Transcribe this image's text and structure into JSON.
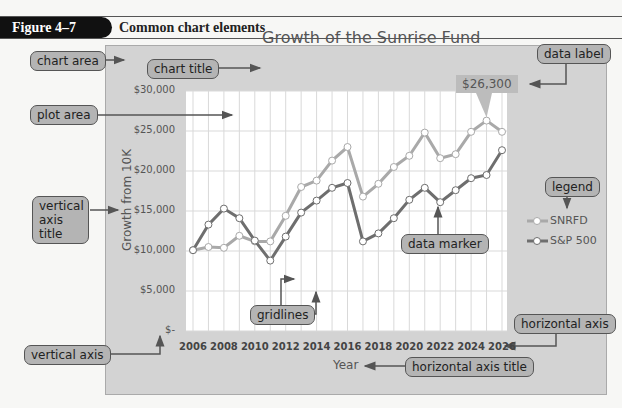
{
  "figure": {
    "number": "Figure 4–7",
    "caption": "Common chart elements"
  },
  "callouts": {
    "chart_area": "chart area",
    "chart_title": "chart title",
    "plot_area": "plot area",
    "vertical_axis_title": "vertical axis title",
    "vertical_axis_title_line1": "vertical",
    "vertical_axis_title_line2": "axis title",
    "vertical_axis": "vertical axis",
    "gridlines": "gridlines",
    "data_marker": "data marker",
    "data_label": "data label",
    "legend": "legend",
    "horizontal_axis": "horizontal axis",
    "horizontal_axis_title": "horizontal axis title"
  },
  "colors": {
    "snrfd": "#a9a9a9",
    "sp500": "#6e6e6e",
    "chart_area": "#d3d3d3",
    "plot_area": "#ffffff",
    "callout": "#b4b4b4"
  },
  "chart_data": {
    "type": "line",
    "title": "Growth of the Sunrise Fund",
    "xlabel": "Year",
    "ylabel": "Growth from 10K",
    "x": [
      2006,
      2007,
      2008,
      2009,
      2010,
      2011,
      2012,
      2013,
      2014,
      2015,
      2016,
      2017,
      2018,
      2019,
      2020,
      2021,
      2022,
      2023,
      2024,
      2025,
      2026
    ],
    "x_tick_labels": [
      "2006",
      "2008",
      "2010",
      "2012",
      "2014",
      "2016",
      "2018",
      "2020",
      "2022",
      "2024",
      "2026"
    ],
    "y_tick_labels": [
      "$30,000",
      "$25,000",
      "$20,000",
      "$15,000",
      "$10,000",
      "$5,000",
      "$-"
    ],
    "ylim": [
      0,
      30000
    ],
    "grid": true,
    "legend_position": "right",
    "series": [
      {
        "name": "SNRFD",
        "values": [
          10100,
          10500,
          10400,
          11900,
          11200,
          11200,
          14400,
          18000,
          18800,
          21300,
          23000,
          16800,
          18400,
          20500,
          21900,
          24800,
          21600,
          22100,
          24900,
          26300,
          24900
        ]
      },
      {
        "name": "S&P 500",
        "values": [
          10100,
          13300,
          15300,
          14100,
          11300,
          8800,
          11800,
          14800,
          16300,
          17900,
          18500,
          11200,
          12200,
          14100,
          16400,
          17900,
          16100,
          17600,
          19100,
          19500,
          22600
        ]
      }
    ],
    "annotations": [
      {
        "text": "$26,300",
        "series": "SNRFD",
        "x": 2025
      }
    ]
  }
}
